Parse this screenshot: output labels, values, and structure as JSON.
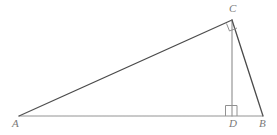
{
  "figure": {
    "kind": "geometry-diagram",
    "background_color": "#ffffff",
    "ink_color_dark": "#4a4a4a",
    "ink_color_light": "#8c8c8c",
    "label_color": "#6d6d6d",
    "vertices": [
      {
        "id": "A",
        "label": "A",
        "x": 19,
        "y": 116,
        "label_x": 12,
        "label_y": 118
      },
      {
        "id": "C",
        "label": "C",
        "x": 232,
        "y": 20,
        "label_x": 229,
        "label_y": 3
      },
      {
        "id": "D",
        "label": "D",
        "x": 232,
        "y": 116,
        "label_x": 229,
        "label_y": 118
      },
      {
        "id": "B",
        "label": "B",
        "x": 263,
        "y": 116,
        "label_x": 259,
        "label_y": 118
      }
    ],
    "segments": [
      {
        "id": "AC",
        "from": "A",
        "to": "C",
        "x1": 19,
        "y1": 116,
        "x2": 232,
        "y2": 20,
        "color": "#4a4a4a",
        "width": 1.3
      },
      {
        "id": "AB",
        "from": "A",
        "to": "B",
        "x1": 19,
        "y1": 116,
        "x2": 263,
        "y2": 116,
        "color": "#8c8c8c",
        "width": 1.0
      },
      {
        "id": "CD",
        "from": "C",
        "to": "D",
        "x1": 232,
        "y1": 20,
        "x2": 232,
        "y2": 116,
        "color": "#8c8c8c",
        "width": 1.1
      },
      {
        "id": "CB",
        "from": "C",
        "to": "B",
        "x1": 232,
        "y1": 20,
        "x2": 263,
        "y2": 116,
        "color": "#4a4a4a",
        "width": 1.3
      }
    ],
    "right_angle_markers": [
      {
        "id": "right-angle-at-D",
        "at": "D",
        "x": 225,
        "y": 105,
        "size": 11,
        "color": "#8c8c8c"
      },
      {
        "id": "right-angle-at-C",
        "at": "C",
        "x": 228,
        "y": 21,
        "size": 8,
        "color": "#8c8c8c"
      }
    ]
  }
}
